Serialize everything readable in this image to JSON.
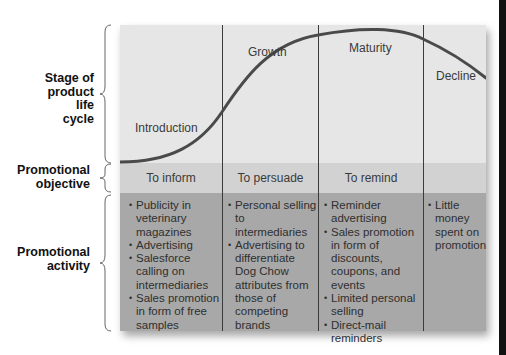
{
  "row_labels": {
    "stage": [
      "Stage of",
      "product",
      "life",
      "cycle"
    ],
    "objective": [
      "Promotional",
      "objective"
    ],
    "activity": [
      "Promotional",
      "activity"
    ]
  },
  "stages": [
    {
      "name": "Introduction",
      "objective": "To inform",
      "activities": [
        "Publicity in veterinary magazines",
        "Advertising",
        "Salesforce calling on intermediaries",
        "Sales promotion in form of free samples"
      ]
    },
    {
      "name": "Growth",
      "objective": "To persuade",
      "activities": [
        "Personal selling to intermediaries",
        "Advertising to differentiate Dog Chow attributes from those of competing brands"
      ]
    },
    {
      "name": "Maturity",
      "objective": "To remind",
      "activities": [
        "Reminder advertising",
        "Sales promotion in form of discounts, coupons, and events",
        "Limited personal selling",
        "Direct-mail reminders"
      ]
    },
    {
      "name": "Decline",
      "objective": "",
      "activities": [
        "Little money spent on promotion"
      ]
    }
  ],
  "colors": {
    "stage_bg": "#e6e6e6",
    "objective_bg": "#d2d2d2",
    "activity_bg": "#a8a8a8",
    "curve": "#4a4a4a"
  }
}
